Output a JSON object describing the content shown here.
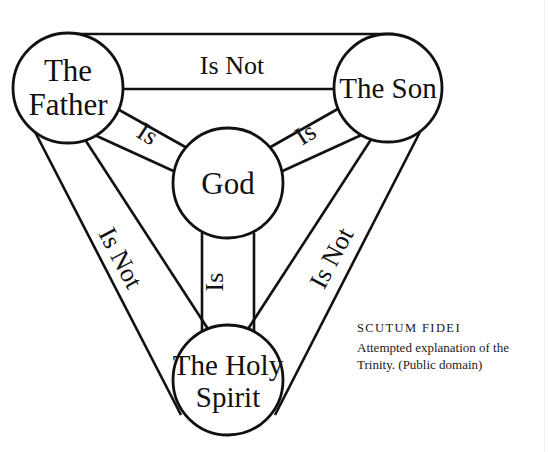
{
  "diagram": {
    "canvas": {
      "width": 548,
      "height": 452
    },
    "ink_color": "#111111",
    "background_color": "#ffffff",
    "nodes": [
      {
        "id": "father",
        "lines": [
          "The",
          "Father"
        ],
        "cx": 68,
        "cy": 88,
        "r": 55
      },
      {
        "id": "son",
        "lines": [
          "The Son"
        ],
        "cx": 388,
        "cy": 88,
        "r": 54
      },
      {
        "id": "god",
        "lines": [
          "God"
        ],
        "cx": 228,
        "cy": 183,
        "r": 55
      },
      {
        "id": "spirit",
        "lines": [
          "The Holy",
          "Spirit"
        ],
        "cx": 228,
        "cy": 380,
        "r": 55
      }
    ],
    "edges": [
      {
        "id": "father-son",
        "from": "father",
        "to": "son",
        "label": "Is Not",
        "label_x": 232,
        "label_y": 74,
        "label_rotate": 0
      },
      {
        "id": "father-spirit",
        "from": "father",
        "to": "spirit",
        "label": "Is Not",
        "label_x": 113,
        "label_y": 262,
        "label_rotate": 62
      },
      {
        "id": "son-spirit",
        "from": "son",
        "to": "spirit",
        "label": "Is Not",
        "label_x": 339,
        "label_y": 262,
        "label_rotate": -62
      },
      {
        "id": "father-god",
        "from": "father",
        "to": "god",
        "label": "Is",
        "label_x": 143,
        "label_y": 141,
        "label_rotate": 33
      },
      {
        "id": "son-god",
        "from": "son",
        "to": "god",
        "label": "Is",
        "label_x": 310,
        "label_y": 141,
        "label_rotate": -33
      },
      {
        "id": "spirit-god",
        "from": "spirit",
        "to": "god",
        "label": "Is",
        "label_x": 221,
        "label_y": 280,
        "label_rotate": -90
      }
    ]
  },
  "caption": {
    "title": "SCUTUM FIDEI",
    "body": "Attempted explanation of the Trinity. (Public domain)"
  }
}
